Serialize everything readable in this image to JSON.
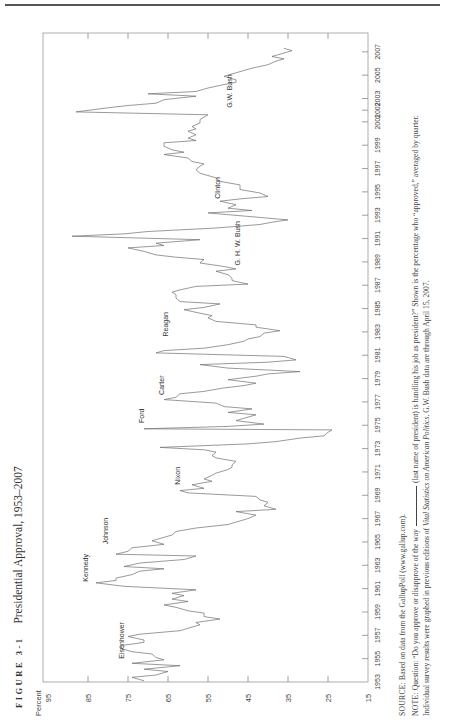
{
  "figure": {
    "label": "FIGURE 3-1",
    "title": "Presidential Approval, 1953–2007"
  },
  "caption": {
    "source_label": "SOURCE:",
    "source_text": "Based on data from the GallupPoll (www.gallup.com).",
    "note_label": "NOTE:",
    "note_text_1": "Question: “Do you approve or disapprove of the way",
    "note_text_2": "(last name of president) is handling his job as president?” Shown is the percentage who “approved,” averaged by quarter.",
    "note_line2_a": "Individual survey results were graphed in previous editions of ",
    "note_line2_italic": "Vital Statistics on American Politics",
    "note_line2_b": ". G.W. Bush data are through April 15, 2007."
  },
  "chart_data": {
    "type": "line",
    "title": "Presidential Approval, 1953–2007",
    "xlabel": "",
    "ylabel": "Percent",
    "ylim": [
      15,
      95
    ],
    "xlim": [
      1953,
      2007.5
    ],
    "y_ticks": [
      95,
      85,
      75,
      65,
      55,
      45,
      35,
      25,
      15
    ],
    "x_tick_labels": [
      "1953",
      "1955",
      "1957",
      "1959",
      "1961",
      "1963",
      "1965",
      "1967",
      "1969",
      "1971",
      "1973",
      "1975",
      "1977",
      "1979",
      "1981",
      "1983",
      "1985",
      "1987",
      "1989",
      "1991",
      "1993",
      "1995",
      "1997",
      "1999",
      "2001",
      "2002",
      "2003",
      "2005",
      "2007"
    ],
    "grid": false,
    "orientation": "rotated 90 degrees (page printed landscape)",
    "annotations": [
      {
        "text": "Eisenhower",
        "x": 1955.0,
        "y": 76
      },
      {
        "text": "Kennedy",
        "x": 1961.6,
        "y": 85
      },
      {
        "text": "Johnson",
        "x": 1964.8,
        "y": 80
      },
      {
        "text": "Nixon",
        "x": 1969.9,
        "y": 62
      },
      {
        "text": "Ford",
        "x": 1975.2,
        "y": 71
      },
      {
        "text": "Carter",
        "x": 1977.6,
        "y": 66
      },
      {
        "text": "Reagan",
        "x": 1982.6,
        "y": 65
      },
      {
        "text": "G. H. W. Bush",
        "x": 1988.7,
        "y": 47
      },
      {
        "text": "Clinton",
        "x": 1994.4,
        "y": 52
      },
      {
        "text": "G.W. Bush",
        "x": 2002.2,
        "y": 49
      }
    ],
    "series": [
      {
        "name": "Presidential approval (quarterly avg.)",
        "points": [
          [
            1953.1,
            71
          ],
          [
            1953.4,
            74
          ],
          [
            1953.6,
            68
          ],
          [
            1953.9,
            65
          ],
          [
            1954.1,
            71
          ],
          [
            1954.4,
            62
          ],
          [
            1954.6,
            74
          ],
          [
            1954.9,
            66
          ],
          [
            1955.1,
            68
          ],
          [
            1955.4,
            69
          ],
          [
            1955.6,
            74
          ],
          [
            1955.9,
            77
          ],
          [
            1956.1,
            77
          ],
          [
            1956.4,
            71
          ],
          [
            1956.6,
            71
          ],
          [
            1956.9,
            75
          ],
          [
            1957.1,
            72
          ],
          [
            1957.4,
            62
          ],
          [
            1957.6,
            60
          ],
          [
            1957.9,
            57
          ],
          [
            1958.1,
            58
          ],
          [
            1958.4,
            52
          ],
          [
            1958.6,
            56
          ],
          [
            1958.9,
            56
          ],
          [
            1959.1,
            60
          ],
          [
            1959.4,
            63
          ],
          [
            1959.6,
            66
          ],
          [
            1959.9,
            60
          ],
          [
            1960.1,
            64
          ],
          [
            1960.4,
            61
          ],
          [
            1960.6,
            64
          ],
          [
            1960.9,
            58
          ],
          [
            1961.2,
            76
          ],
          [
            1961.5,
            83
          ],
          [
            1961.7,
            78
          ],
          [
            1961.9,
            78
          ],
          [
            1962.2,
            74
          ],
          [
            1962.5,
            72
          ],
          [
            1962.7,
            66
          ],
          [
            1962.9,
            76
          ],
          [
            1963.2,
            72
          ],
          [
            1963.5,
            61
          ],
          [
            1963.8,
            58
          ],
          [
            1963.95,
            78
          ],
          [
            1964.2,
            75
          ],
          [
            1964.5,
            74
          ],
          [
            1964.8,
            66
          ],
          [
            1965.1,
            69
          ],
          [
            1965.4,
            66
          ],
          [
            1965.6,
            64
          ],
          [
            1965.9,
            63
          ],
          [
            1966.2,
            58
          ],
          [
            1966.5,
            50
          ],
          [
            1966.7,
            48
          ],
          [
            1967.0,
            45
          ],
          [
            1967.3,
            43
          ],
          [
            1967.6,
            48
          ],
          [
            1967.8,
            38
          ],
          [
            1968.1,
            41
          ],
          [
            1968.4,
            40
          ],
          [
            1968.6,
            42
          ],
          [
            1968.9,
            43
          ],
          [
            1969.2,
            60
          ],
          [
            1969.4,
            62
          ],
          [
            1969.6,
            56
          ],
          [
            1969.9,
            59
          ],
          [
            1970.2,
            54
          ],
          [
            1970.4,
            56
          ],
          [
            1970.7,
            54
          ],
          [
            1970.9,
            53
          ],
          [
            1971.2,
            50
          ],
          [
            1971.4,
            49
          ],
          [
            1971.6,
            49
          ],
          [
            1971.9,
            48
          ],
          [
            1972.2,
            53
          ],
          [
            1972.4,
            54
          ],
          [
            1972.7,
            53
          ],
          [
            1972.9,
            56
          ],
          [
            1973.1,
            67
          ],
          [
            1973.4,
            45
          ],
          [
            1973.6,
            38
          ],
          [
            1973.9,
            32
          ],
          [
            1974.1,
            26
          ],
          [
            1974.4,
            25
          ],
          [
            1974.6,
            24
          ],
          [
            1974.7,
            71
          ],
          [
            1974.9,
            50
          ],
          [
            1975.1,
            41
          ],
          [
            1975.4,
            48
          ],
          [
            1975.6,
            46
          ],
          [
            1975.9,
            43
          ],
          [
            1976.1,
            50
          ],
          [
            1976.4,
            44
          ],
          [
            1976.6,
            51
          ],
          [
            1976.9,
            53
          ],
          [
            1977.2,
            66
          ],
          [
            1977.4,
            63
          ],
          [
            1977.7,
            62
          ],
          [
            1977.9,
            56
          ],
          [
            1978.2,
            51
          ],
          [
            1978.4,
            46
          ],
          [
            1978.6,
            43
          ],
          [
            1978.9,
            50
          ],
          [
            1979.2,
            43
          ],
          [
            1979.4,
            40
          ],
          [
            1979.6,
            32
          ],
          [
            1979.9,
            50
          ],
          [
            1980.2,
            57
          ],
          [
            1980.4,
            40
          ],
          [
            1980.6,
            33
          ],
          [
            1980.9,
            36
          ],
          [
            1981.2,
            68
          ],
          [
            1981.4,
            66
          ],
          [
            1981.6,
            56
          ],
          [
            1981.9,
            50
          ],
          [
            1982.2,
            46
          ],
          [
            1982.4,
            45
          ],
          [
            1982.6,
            42
          ],
          [
            1982.9,
            41
          ],
          [
            1983.1,
            37
          ],
          [
            1983.4,
            43
          ],
          [
            1983.6,
            43
          ],
          [
            1983.9,
            53
          ],
          [
            1984.2,
            55
          ],
          [
            1984.4,
            54
          ],
          [
            1984.6,
            57
          ],
          [
            1984.9,
            61
          ],
          [
            1985.1,
            56
          ],
          [
            1985.4,
            52
          ],
          [
            1985.6,
            62
          ],
          [
            1985.9,
            63
          ],
          [
            1986.2,
            63
          ],
          [
            1986.4,
            64
          ],
          [
            1986.6,
            62
          ],
          [
            1986.9,
            58
          ],
          [
            1987.1,
            45
          ],
          [
            1987.4,
            49
          ],
          [
            1987.6,
            49
          ],
          [
            1987.9,
            50
          ],
          [
            1988.2,
            53
          ],
          [
            1988.4,
            48
          ],
          [
            1988.6,
            51
          ],
          [
            1988.9,
            57
          ],
          [
            1989.2,
            56
          ],
          [
            1989.4,
            63
          ],
          [
            1989.6,
            68
          ],
          [
            1989.9,
            71
          ],
          [
            1990.2,
            75
          ],
          [
            1990.4,
            66
          ],
          [
            1990.6,
            68
          ],
          [
            1990.9,
            57
          ],
          [
            1991.2,
            89
          ],
          [
            1991.4,
            76
          ],
          [
            1991.6,
            70
          ],
          [
            1991.9,
            53
          ],
          [
            1992.2,
            42
          ],
          [
            1992.4,
            39
          ],
          [
            1992.6,
            35
          ],
          [
            1992.9,
            45
          ],
          [
            1993.2,
            55
          ],
          [
            1993.4,
            44
          ],
          [
            1993.6,
            50
          ],
          [
            1993.9,
            48
          ],
          [
            1994.2,
            52
          ],
          [
            1994.4,
            47
          ],
          [
            1994.6,
            40
          ],
          [
            1994.9,
            42
          ],
          [
            1995.2,
            47
          ],
          [
            1995.4,
            47
          ],
          [
            1995.6,
            47
          ],
          [
            1995.9,
            52
          ],
          [
            1996.2,
            53
          ],
          [
            1996.4,
            55
          ],
          [
            1996.6,
            57
          ],
          [
            1996.9,
            58
          ],
          [
            1997.2,
            57
          ],
          [
            1997.4,
            56
          ],
          [
            1997.6,
            59
          ],
          [
            1997.9,
            60
          ],
          [
            1998.2,
            66
          ],
          [
            1998.4,
            61
          ],
          [
            1998.6,
            64
          ],
          [
            1998.9,
            66
          ],
          [
            1999.2,
            66
          ],
          [
            1999.4,
            58
          ],
          [
            1999.6,
            60
          ],
          [
            1999.9,
            58
          ],
          [
            2000.2,
            60
          ],
          [
            2000.4,
            58
          ],
          [
            2000.6,
            59
          ],
          [
            2000.9,
            57
          ],
          [
            2001.2,
            57
          ],
          [
            2001.4,
            56
          ],
          [
            2001.6,
            55
          ],
          [
            2001.85,
            88
          ],
          [
            2002.2,
            80
          ],
          [
            2002.4,
            75
          ],
          [
            2002.6,
            68
          ],
          [
            2002.9,
            66
          ],
          [
            2003.2,
            58
          ],
          [
            2003.4,
            70
          ],
          [
            2003.6,
            58
          ],
          [
            2003.9,
            55
          ],
          [
            2004.2,
            51
          ],
          [
            2004.4,
            48
          ],
          [
            2004.6,
            48
          ],
          [
            2004.9,
            51
          ],
          [
            2005.2,
            48
          ],
          [
            2005.4,
            46
          ],
          [
            2005.6,
            44
          ],
          [
            2005.9,
            40
          ],
          [
            2006.2,
            38
          ],
          [
            2006.4,
            36
          ],
          [
            2006.6,
            39
          ],
          [
            2006.9,
            36
          ],
          [
            2007.1,
            34
          ],
          [
            2007.3,
            36
          ]
        ]
      }
    ]
  }
}
